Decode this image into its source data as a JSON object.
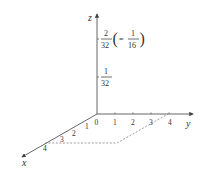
{
  "diagram": {
    "type": "3d-axes",
    "axes": {
      "x": {
        "label": "x",
        "ticks": [
          "1",
          "2",
          "3",
          "4"
        ]
      },
      "y": {
        "label": "y",
        "ticks": [
          "1",
          "2",
          "3",
          "4"
        ]
      },
      "z": {
        "label": "z"
      }
    },
    "origin_label": "0",
    "z_marks": [
      {
        "num": "1",
        "den": "32"
      },
      {
        "num": "2",
        "den": "32",
        "eq_prefix": "=",
        "eq_num": "1",
        "eq_den": "16"
      }
    ],
    "base_region": "dashed parallelogram from x=4 to y=4"
  },
  "colors": {
    "axis": "#555555",
    "text": "#333333",
    "dashed": "#777777"
  }
}
